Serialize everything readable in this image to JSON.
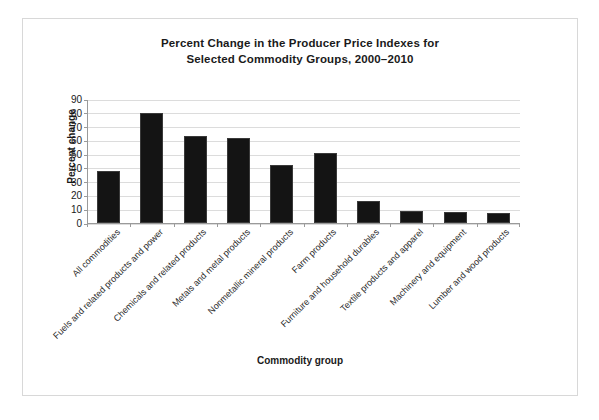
{
  "chart_data": {
    "type": "bar",
    "title": "Percent Change in the Producer Price Indexes for Selected Commodity Groups, 2000–2010",
    "title_lines": [
      "Percent Change in the Producer Price Indexes for",
      "Selected Commodity Groups, 2000–2010"
    ],
    "xlabel": "Commodity group",
    "ylabel": "Percent change",
    "categories": [
      "All commodities",
      "Fuels and related products and power",
      "Chemicals and related products",
      "Metals and metal products",
      "Nonmetallic mineral products",
      "Farm products",
      "Furniture and household durables",
      "Textile products and apparel",
      "Machinery and equipment",
      "Lumber and wood products"
    ],
    "values": [
      38,
      80,
      63,
      62,
      42,
      51,
      16,
      9,
      8,
      7
    ],
    "ylim": [
      0,
      90
    ],
    "yticks": [
      0,
      10,
      20,
      30,
      40,
      50,
      60,
      70,
      80,
      90
    ],
    "ytick_labels": [
      "0",
      "10",
      "20",
      "30",
      "40",
      "50",
      "60",
      "70",
      "80",
      "90"
    ],
    "grid": true,
    "legend": "none",
    "bar_color": "#141414",
    "grid_color": "#dcdcdc",
    "axis_color": "#9a9a9a",
    "frame_color": "#d8d8d8"
  }
}
